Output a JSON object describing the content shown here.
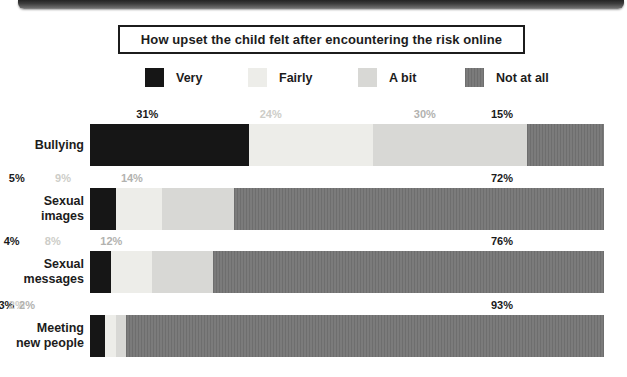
{
  "title": {
    "text": "How upset the child felt after encountering the risk online"
  },
  "chart_data": {
    "type": "bar",
    "orientation": "horizontal-stacked",
    "title": "How upset the child felt after encountering the risk online",
    "categories": [
      "Bullying",
      "Sexual images",
      "Sexual messages",
      "Meeting new people"
    ],
    "category_display": [
      "Bullying",
      "Sexual\nimages",
      "Sexual\nmessages",
      "Meeting\nnew people"
    ],
    "series": [
      {
        "name": "Very",
        "color": "#161616",
        "label_color": "#1a1a1a",
        "texture": "solid",
        "values": [
          31,
          5,
          4,
          3
        ]
      },
      {
        "name": "Fairly",
        "color": "#edede9",
        "label_color": "#cdcdc8",
        "texture": "solid",
        "values": [
          24,
          9,
          8,
          2
        ]
      },
      {
        "name": "A bit",
        "color": "#d8d8d5",
        "label_color": "#b2b2af",
        "texture": "solid",
        "values": [
          30,
          14,
          12,
          2
        ]
      },
      {
        "name": "Not at all",
        "color": "#767676",
        "label_color": "#1a1a1a",
        "texture": "vertical-stripes",
        "values": [
          15,
          72,
          76,
          93
        ]
      }
    ],
    "value_suffix": "%",
    "xlim": [
      0,
      100
    ],
    "grid": false,
    "legend_position": "top"
  },
  "legend": {
    "swatch_stripe_dark": "#6e6e6e",
    "swatch_stripe_light": "#7b7b7b"
  }
}
